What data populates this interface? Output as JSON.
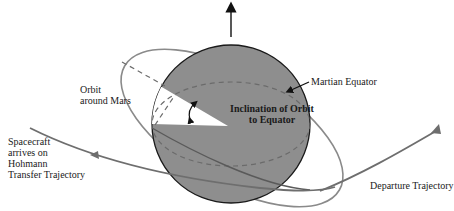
{
  "diagram": {
    "colors": {
      "planet_fill": "#8c8c8c",
      "planet_outline": "#1a1a1a",
      "orbit_line": "#7a7a7a",
      "trajectory_line": "#6e6e6e",
      "dashed_line": "#6b6b6b",
      "wedge_fill": "#ffffff",
      "text": "#1a1a1a"
    },
    "labels": {
      "orbit": "Orbit\naround Mars",
      "equator": "Martian Equator",
      "inclination": "Inclination of Orbit\nto Equator",
      "arrival": "Spacecraft\narrives on\nHohmann\nTransfer Trajectory",
      "departure": "Departure Trajectory"
    },
    "elements": {
      "planet": "Mars",
      "rotation_axis_arrow": "north-axis-arrow",
      "inclination_angle_marker": "double-headed-curved-arrow"
    }
  }
}
